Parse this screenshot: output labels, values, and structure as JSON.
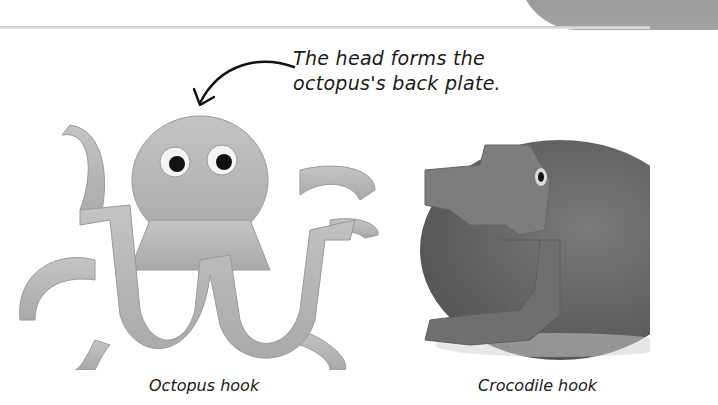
{
  "annotation": {
    "line1": "The head forms the",
    "line2": "octopus's back plate."
  },
  "figures": [
    {
      "caption": "Octopus hook",
      "icon": "octopus-hook-photo"
    },
    {
      "caption": "Crocodile hook",
      "icon": "crocodile-hook-photo"
    }
  ],
  "colors": {
    "octopus": "#b9b9b9",
    "crocodile": "#6e6e6e",
    "rule": "#cccccc"
  }
}
